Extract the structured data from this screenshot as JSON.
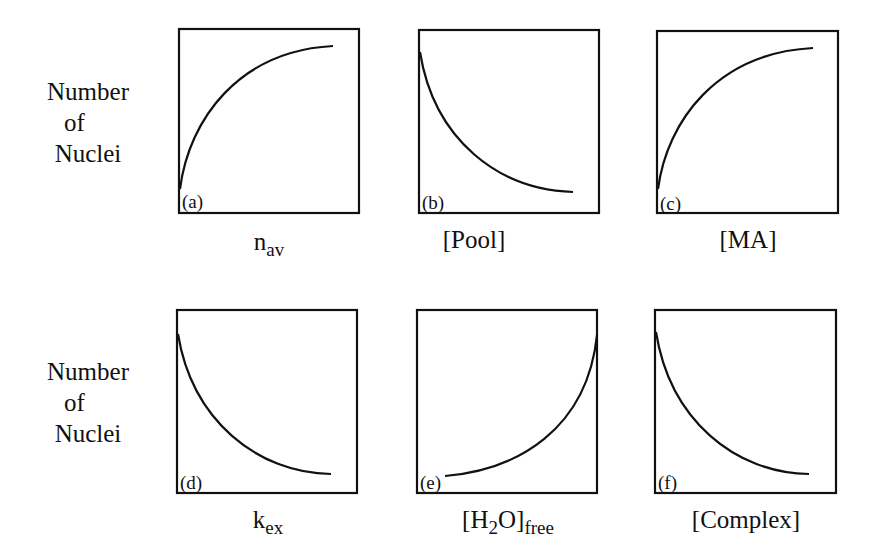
{
  "figure": {
    "y_axis_label_lines": [
      "Number",
      "of",
      "Nuclei"
    ],
    "panels": [
      {
        "tag": "(a)",
        "x_main": "n",
        "x_sub": "av",
        "x_pre": "",
        "x_post": "",
        "trend": "increasing, saturating"
      },
      {
        "tag": "(b)",
        "x_main": "[Pool]",
        "x_sub": "",
        "x_pre": "",
        "x_post": "",
        "trend": "decreasing, decaying"
      },
      {
        "tag": "(c)",
        "x_main": "[MA]",
        "x_sub": "",
        "x_pre": "",
        "x_post": "",
        "trend": "increasing, saturating"
      },
      {
        "tag": "(d)",
        "x_main": "k",
        "x_sub": "ex",
        "x_pre": "",
        "x_post": "",
        "trend": "decreasing, decaying"
      },
      {
        "tag": "(e)",
        "x_pre": "[H",
        "x_mid_sub": "2",
        "x_main": "O]",
        "x_sub": "free",
        "x_post": "",
        "trend": "increasing, accelerating"
      },
      {
        "tag": "(f)",
        "x_main": "[Complex]",
        "x_sub": "",
        "x_pre": "",
        "x_post": "",
        "trend": "decreasing, decaying"
      }
    ]
  },
  "colors": {
    "line": "#111111",
    "background": "#ffffff"
  }
}
